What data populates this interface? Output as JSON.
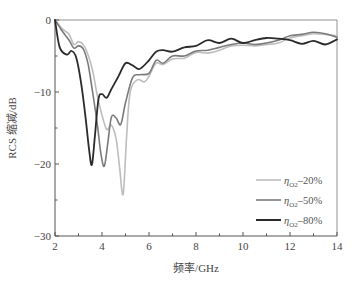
{
  "chart_data": {
    "type": "line",
    "title": "",
    "xlabel": "频率/GHz",
    "ylabel": "RCS 缩减/dB",
    "xlim": [
      2,
      14
    ],
    "ylim": [
      -30,
      0
    ],
    "xticks": [
      2,
      4,
      6,
      8,
      10,
      12,
      14
    ],
    "xticks_minor": [
      3,
      5,
      7,
      9,
      11,
      13
    ],
    "yticks": [
      0,
      -10,
      -20,
      -30
    ],
    "yticks_minor": [
      -5,
      -15,
      -25
    ],
    "grid": false,
    "legend_position": "lower right",
    "series": [
      {
        "name": "η_O2–20%",
        "legend_symbol": "η",
        "legend_sub": "O2",
        "legend_value": "–20%",
        "color": "#bdbdbd",
        "x": [
          2.0,
          2.3,
          2.6,
          2.8,
          3.0,
          3.2,
          3.4,
          3.6,
          3.8,
          4.0,
          4.2,
          4.4,
          4.6,
          4.75,
          4.9,
          5.05,
          5.2,
          5.5,
          5.8,
          6.0,
          6.3,
          6.6,
          7.0,
          7.5,
          8.0,
          8.5,
          9.0,
          9.5,
          10.0,
          10.5,
          11.0,
          11.5,
          12.0,
          12.5,
          13.0,
          13.5,
          14.0
        ],
        "y": [
          0.0,
          -1.2,
          -2.0,
          -3.4,
          -3.0,
          -3.4,
          -4.8,
          -7.0,
          -10.5,
          -13.2,
          -15.2,
          -14.6,
          -16.5,
          -20.5,
          -24.2,
          -16.0,
          -10.0,
          -8.3,
          -8.6,
          -7.8,
          -6.0,
          -6.2,
          -5.4,
          -5.3,
          -4.5,
          -4.6,
          -4.2,
          -3.6,
          -3.5,
          -3.6,
          -3.4,
          -3.2,
          -2.5,
          -2.2,
          -1.9,
          -2.0,
          -2.2
        ]
      },
      {
        "name": "η_O2–50%",
        "legend_symbol": "η",
        "legend_sub": "O2",
        "legend_value": "–50%",
        "color": "#7a7a7a",
        "x": [
          2.0,
          2.3,
          2.6,
          2.8,
          3.0,
          3.2,
          3.4,
          3.6,
          3.8,
          3.95,
          4.1,
          4.25,
          4.4,
          4.6,
          4.8,
          5.0,
          5.3,
          5.6,
          6.0,
          6.3,
          6.6,
          7.0,
          7.5,
          8.0,
          8.5,
          9.0,
          9.5,
          10.0,
          10.5,
          11.0,
          11.5,
          12.0,
          12.5,
          13.0,
          13.5,
          14.0
        ],
        "y": [
          0.0,
          -1.5,
          -2.8,
          -3.9,
          -3.6,
          -4.0,
          -6.0,
          -10.0,
          -14.5,
          -18.5,
          -20.3,
          -17.0,
          -13.5,
          -13.6,
          -14.5,
          -11.5,
          -8.0,
          -7.6,
          -7.4,
          -5.6,
          -6.0,
          -5.0,
          -5.0,
          -4.3,
          -4.2,
          -3.8,
          -3.4,
          -3.2,
          -3.4,
          -3.2,
          -2.8,
          -2.2,
          -2.0,
          -1.7,
          -1.9,
          -2.4
        ]
      },
      {
        "name": "η_O2–80%",
        "legend_symbol": "η",
        "legend_sub": "O2",
        "legend_value": "–80%",
        "color": "#2a2a2a",
        "x": [
          2.0,
          2.2,
          2.5,
          2.7,
          2.9,
          3.1,
          3.3,
          3.45,
          3.57,
          3.7,
          3.85,
          4.0,
          4.2,
          4.4,
          4.7,
          5.0,
          5.3,
          5.6,
          6.0,
          6.3,
          6.6,
          7.0,
          7.5,
          8.0,
          8.5,
          9.0,
          9.5,
          10.0,
          10.5,
          11.0,
          11.5,
          12.0,
          12.5,
          13.0,
          13.5,
          14.0
        ],
        "y": [
          0.0,
          -3.8,
          -4.8,
          -4.3,
          -5.2,
          -8.5,
          -13.5,
          -18.0,
          -20.1,
          -16.0,
          -11.0,
          -10.3,
          -10.8,
          -9.6,
          -7.8,
          -6.0,
          -6.3,
          -6.8,
          -5.6,
          -4.4,
          -4.2,
          -4.4,
          -3.8,
          -3.6,
          -2.8,
          -3.2,
          -2.6,
          -3.2,
          -2.8,
          -2.5,
          -2.6,
          -2.8,
          -3.3,
          -2.9,
          -3.4,
          -2.7
        ]
      }
    ]
  }
}
